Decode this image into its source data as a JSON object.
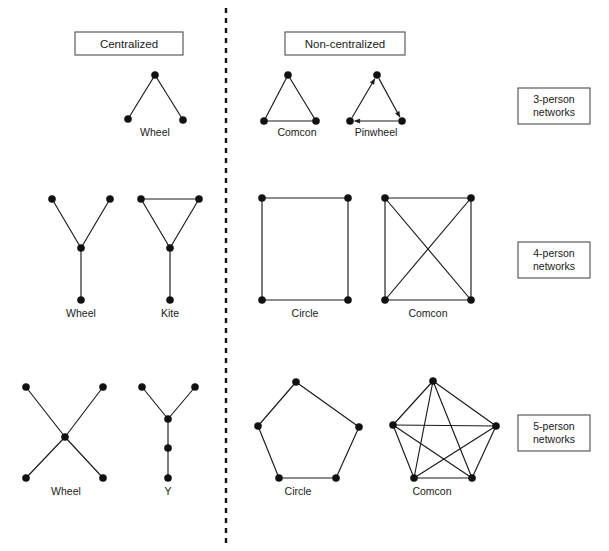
{
  "figure": {
    "width": 609,
    "height": 551,
    "background": "#ffffff",
    "node_color": "#111111",
    "edge_color": "#1a1a1a",
    "box_border_color": "#4d4d4d",
    "divider_color": "#111111"
  },
  "column_headers": [
    {
      "label": "Centralized",
      "x": 75,
      "y": 32,
      "w": 108,
      "h": 23
    },
    {
      "label": "Non-centralized",
      "x": 285,
      "y": 32,
      "w": 120,
      "h": 23
    }
  ],
  "divider": {
    "x": 226,
    "y1": 8,
    "y2": 545,
    "style": "dashed"
  },
  "row_labels": [
    {
      "line1": "3-person",
      "line2": "networks",
      "x": 518,
      "y": 88,
      "w": 72,
      "h": 36
    },
    {
      "line1": "4-person",
      "line2": "networks",
      "x": 518,
      "y": 242,
      "w": 72,
      "h": 36
    },
    {
      "line1": "5-person",
      "line2": "networks",
      "x": 518,
      "y": 415,
      "w": 72,
      "h": 36
    }
  ],
  "networks": [
    {
      "name": "Wheel",
      "group": "3-person",
      "column": "Centralized",
      "directed": false,
      "label": {
        "text": "Wheel",
        "x": 155,
        "y": 136
      },
      "nodes": [
        {
          "id": "c",
          "x": 155,
          "y": 75
        },
        {
          "id": "l",
          "x": 128,
          "y": 119
        },
        {
          "id": "r",
          "x": 183,
          "y": 120
        }
      ],
      "edges": [
        [
          "c",
          "l"
        ],
        [
          "c",
          "r"
        ]
      ]
    },
    {
      "name": "Comcon",
      "group": "3-person",
      "column": "Non-centralized",
      "directed": false,
      "label": {
        "text": "Comcon",
        "x": 297,
        "y": 136
      },
      "nodes": [
        {
          "id": "t",
          "x": 288,
          "y": 75
        },
        {
          "id": "bl",
          "x": 264,
          "y": 121
        },
        {
          "id": "br",
          "x": 316,
          "y": 121
        }
      ],
      "edges": [
        [
          "t",
          "bl"
        ],
        [
          "t",
          "br"
        ],
        [
          "bl",
          "br"
        ]
      ]
    },
    {
      "name": "Pinwheel",
      "group": "3-person",
      "column": "Non-centralized",
      "directed": true,
      "label": {
        "text": "Pinwheel",
        "x": 376,
        "y": 136
      },
      "nodes": [
        {
          "id": "t",
          "x": 377,
          "y": 75
        },
        {
          "id": "bl",
          "x": 350,
          "y": 121
        },
        {
          "id": "br",
          "x": 402,
          "y": 121
        }
      ],
      "edges": [
        [
          "bl",
          "t"
        ],
        [
          "t",
          "br"
        ],
        [
          "br",
          "bl"
        ]
      ]
    },
    {
      "name": "Wheel",
      "group": "4-person",
      "column": "Centralized",
      "directed": false,
      "label": {
        "text": "Wheel",
        "x": 81,
        "y": 317
      },
      "nodes": [
        {
          "id": "tl",
          "x": 52,
          "y": 199
        },
        {
          "id": "tr",
          "x": 110,
          "y": 199
        },
        {
          "id": "c",
          "x": 81,
          "y": 248
        },
        {
          "id": "b",
          "x": 81,
          "y": 300
        }
      ],
      "edges": [
        [
          "tl",
          "c"
        ],
        [
          "tr",
          "c"
        ],
        [
          "c",
          "b"
        ]
      ]
    },
    {
      "name": "Kite",
      "group": "4-person",
      "column": "Centralized",
      "directed": false,
      "label": {
        "text": "Kite",
        "x": 170,
        "y": 317
      },
      "nodes": [
        {
          "id": "tl",
          "x": 141,
          "y": 199
        },
        {
          "id": "tr",
          "x": 199,
          "y": 199
        },
        {
          "id": "c",
          "x": 170,
          "y": 248
        },
        {
          "id": "b",
          "x": 170,
          "y": 300
        }
      ],
      "edges": [
        [
          "tl",
          "tr"
        ],
        [
          "tl",
          "c"
        ],
        [
          "tr",
          "c"
        ],
        [
          "c",
          "b"
        ]
      ]
    },
    {
      "name": "Circle",
      "group": "4-person",
      "column": "Non-centralized",
      "directed": false,
      "label": {
        "text": "Circle",
        "x": 305,
        "y": 317
      },
      "nodes": [
        {
          "id": "tl",
          "x": 262,
          "y": 198
        },
        {
          "id": "tr",
          "x": 348,
          "y": 198
        },
        {
          "id": "br",
          "x": 348,
          "y": 300
        },
        {
          "id": "bl",
          "x": 262,
          "y": 300
        }
      ],
      "edges": [
        [
          "tl",
          "tr"
        ],
        [
          "tr",
          "br"
        ],
        [
          "br",
          "bl"
        ],
        [
          "bl",
          "tl"
        ]
      ]
    },
    {
      "name": "Comcon",
      "group": "4-person",
      "column": "Non-centralized",
      "directed": false,
      "label": {
        "text": "Comcon",
        "x": 428,
        "y": 317
      },
      "nodes": [
        {
          "id": "tl",
          "x": 385,
          "y": 198
        },
        {
          "id": "tr",
          "x": 471,
          "y": 198
        },
        {
          "id": "br",
          "x": 471,
          "y": 300
        },
        {
          "id": "bl",
          "x": 385,
          "y": 300
        }
      ],
      "edges": [
        [
          "tl",
          "tr"
        ],
        [
          "tr",
          "br"
        ],
        [
          "br",
          "bl"
        ],
        [
          "bl",
          "tl"
        ],
        [
          "tl",
          "br"
        ],
        [
          "tr",
          "bl"
        ]
      ]
    },
    {
      "name": "Wheel",
      "group": "5-person",
      "column": "Centralized",
      "directed": false,
      "label": {
        "text": "Wheel",
        "x": 66,
        "y": 495
      },
      "nodes": [
        {
          "id": "c",
          "x": 65,
          "y": 437
        },
        {
          "id": "tl",
          "x": 26,
          "y": 387
        },
        {
          "id": "tr",
          "x": 103,
          "y": 387
        },
        {
          "id": "bl",
          "x": 26,
          "y": 478
        },
        {
          "id": "br",
          "x": 103,
          "y": 478
        }
      ],
      "edges": [
        [
          "c",
          "tl"
        ],
        [
          "c",
          "tr"
        ],
        [
          "c",
          "bl"
        ],
        [
          "c",
          "br"
        ]
      ]
    },
    {
      "name": "Y",
      "group": "5-person",
      "column": "Centralized",
      "directed": false,
      "label": {
        "text": "Y",
        "x": 168,
        "y": 495
      },
      "nodes": [
        {
          "id": "tl",
          "x": 142,
          "y": 387
        },
        {
          "id": "tr",
          "x": 195,
          "y": 387
        },
        {
          "id": "j",
          "x": 168,
          "y": 419
        },
        {
          "id": "m",
          "x": 168,
          "y": 448
        },
        {
          "id": "b",
          "x": 168,
          "y": 478
        }
      ],
      "edges": [
        [
          "tl",
          "j"
        ],
        [
          "tr",
          "j"
        ],
        [
          "j",
          "m"
        ],
        [
          "m",
          "b"
        ]
      ]
    },
    {
      "name": "Circle",
      "group": "5-person",
      "column": "Non-centralized",
      "directed": false,
      "label": {
        "text": "Circle",
        "x": 298,
        "y": 495
      },
      "nodes": [
        {
          "id": "n1",
          "x": 296,
          "y": 382
        },
        {
          "id": "n2",
          "x": 359,
          "y": 427
        },
        {
          "id": "n3",
          "x": 336,
          "y": 478
        },
        {
          "id": "n4",
          "x": 279,
          "y": 478
        },
        {
          "id": "n5",
          "x": 258,
          "y": 426
        }
      ],
      "edges": [
        [
          "n1",
          "n2"
        ],
        [
          "n2",
          "n3"
        ],
        [
          "n3",
          "n4"
        ],
        [
          "n4",
          "n5"
        ],
        [
          "n5",
          "n1"
        ]
      ]
    },
    {
      "name": "Comcon",
      "group": "5-person",
      "column": "Non-centralized",
      "directed": false,
      "label": {
        "text": "Comcon",
        "x": 432,
        "y": 495
      },
      "nodes": [
        {
          "id": "n1",
          "x": 433,
          "y": 381
        },
        {
          "id": "n2",
          "x": 496,
          "y": 426
        },
        {
          "id": "n3",
          "x": 472,
          "y": 478
        },
        {
          "id": "n4",
          "x": 414,
          "y": 478
        },
        {
          "id": "n5",
          "x": 393,
          "y": 425
        }
      ],
      "edges": [
        [
          "n1",
          "n2"
        ],
        [
          "n2",
          "n3"
        ],
        [
          "n3",
          "n4"
        ],
        [
          "n4",
          "n5"
        ],
        [
          "n5",
          "n1"
        ],
        [
          "n1",
          "n3"
        ],
        [
          "n1",
          "n4"
        ],
        [
          "n2",
          "n4"
        ],
        [
          "n2",
          "n5"
        ],
        [
          "n3",
          "n5"
        ]
      ]
    }
  ],
  "node_radius": 3.6,
  "arrow_size": 5.2
}
